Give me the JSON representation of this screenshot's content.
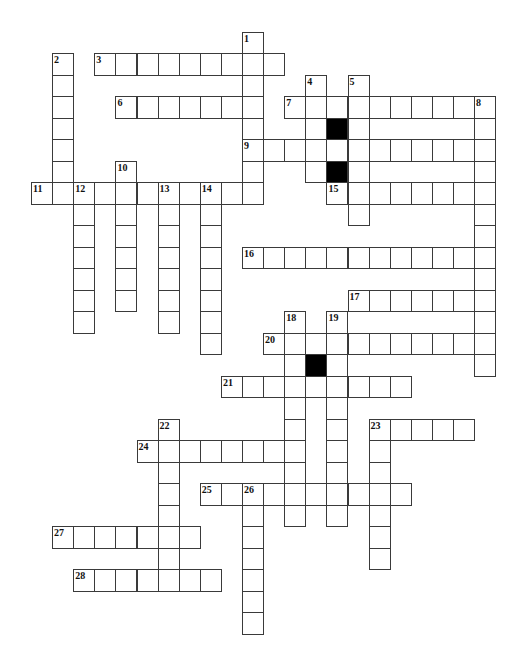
{
  "puzzle": {
    "title": "",
    "grid_size": {
      "rows": 28,
      "cols": 22
    },
    "colors": {
      "cell": "#ffffff",
      "block": "#000000",
      "line": "#3a3a3a"
    },
    "entries": [
      {
        "number": 1,
        "direction": "down",
        "row": 0,
        "col": 10,
        "length": 8
      },
      {
        "number": 2,
        "direction": "down",
        "row": 1,
        "col": 1,
        "length": 7
      },
      {
        "number": 3,
        "direction": "across",
        "row": 1,
        "col": 3,
        "length": 9
      },
      {
        "number": 4,
        "direction": "down",
        "row": 2,
        "col": 13,
        "length": 5
      },
      {
        "number": 5,
        "direction": "down",
        "row": 2,
        "col": 15,
        "length": 7
      },
      {
        "number": 6,
        "direction": "across",
        "row": 3,
        "col": 4,
        "length": 7
      },
      {
        "number": 7,
        "direction": "across",
        "row": 3,
        "col": 12,
        "length": 10
      },
      {
        "number": 8,
        "direction": "down",
        "row": 3,
        "col": 21,
        "length": 13
      },
      {
        "number": 9,
        "direction": "across",
        "row": 5,
        "col": 10,
        "length": 12
      },
      {
        "number": 10,
        "direction": "down",
        "row": 6,
        "col": 4,
        "length": 7
      },
      {
        "number": 11,
        "direction": "across",
        "row": 7,
        "col": 0,
        "length": 11
      },
      {
        "number": 12,
        "direction": "down",
        "row": 7,
        "col": 2,
        "length": 7
      },
      {
        "number": 13,
        "direction": "down",
        "row": 7,
        "col": 6,
        "length": 7
      },
      {
        "number": 14,
        "direction": "down",
        "row": 7,
        "col": 8,
        "length": 8
      },
      {
        "number": 15,
        "direction": "across",
        "row": 7,
        "col": 14,
        "length": 8
      },
      {
        "number": 16,
        "direction": "across",
        "row": 10,
        "col": 10,
        "length": 12
      },
      {
        "number": 17,
        "direction": "across",
        "row": 12,
        "col": 15,
        "length": 7
      },
      {
        "number": 18,
        "direction": "down",
        "row": 13,
        "col": 12,
        "length": 10
      },
      {
        "number": 19,
        "direction": "down",
        "row": 13,
        "col": 14,
        "length": 10
      },
      {
        "number": 20,
        "direction": "across",
        "row": 14,
        "col": 11,
        "length": 11
      },
      {
        "number": 21,
        "direction": "across",
        "row": 16,
        "col": 9,
        "length": 9
      },
      {
        "number": 22,
        "direction": "down",
        "row": 18,
        "col": 6,
        "length": 8
      },
      {
        "number": 23,
        "direction": "across",
        "row": 18,
        "col": 16,
        "length": 5
      },
      {
        "number": 23,
        "direction": "down",
        "row": 18,
        "col": 16,
        "length": 7
      },
      {
        "number": 24,
        "direction": "across",
        "row": 19,
        "col": 5,
        "length": 8
      },
      {
        "number": 25,
        "direction": "across",
        "row": 21,
        "col": 8,
        "length": 10
      },
      {
        "number": 26,
        "direction": "down",
        "row": 21,
        "col": 10,
        "length": 7
      },
      {
        "number": 27,
        "direction": "across",
        "row": 23,
        "col": 1,
        "length": 7
      },
      {
        "number": 28,
        "direction": "across",
        "row": 25,
        "col": 2,
        "length": 7
      }
    ],
    "black_cells": [
      {
        "row": 4,
        "col": 14
      },
      {
        "row": 6,
        "col": 14
      },
      {
        "row": 15,
        "col": 13
      }
    ]
  }
}
